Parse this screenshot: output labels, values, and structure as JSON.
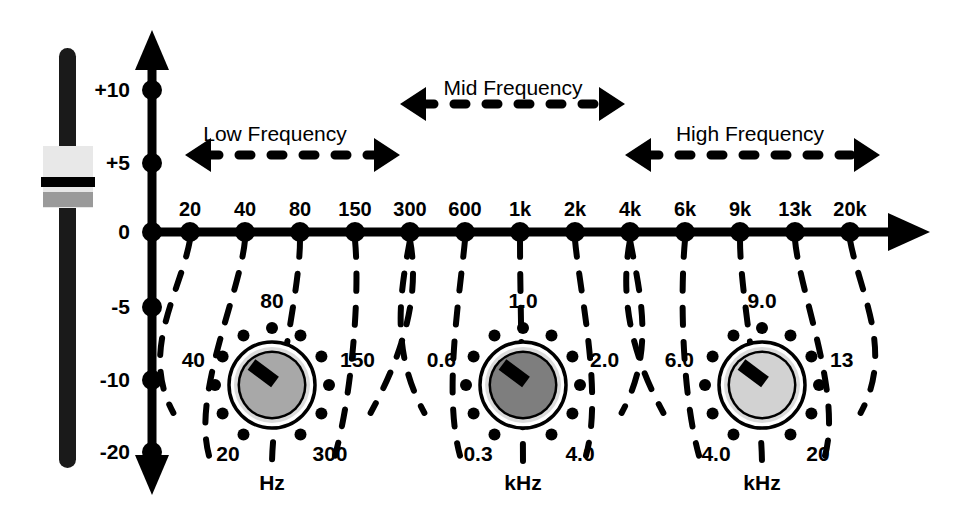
{
  "figure": {
    "type": "equalizer-diagram",
    "background": "#ffffff",
    "ink": "#000000"
  },
  "fader": {
    "name": "level-fader",
    "track_color": "#1a1a1a",
    "cap_color": "#e8e8e8",
    "cap_band_color": "#9a9a9a",
    "position_label": "+5"
  },
  "axes": {
    "y_axis": {
      "label_unit": "dB",
      "ticks": [
        {
          "label": "+10",
          "y": 90
        },
        {
          "label": "+5",
          "y": 163
        },
        {
          "label": "0",
          "y": 232
        },
        {
          "label": "-5",
          "y": 307
        },
        {
          "label": "-10",
          "y": 380
        },
        {
          "label": "-20",
          "y": 452
        }
      ]
    },
    "x_axis": {
      "label_unit": "Hz",
      "ticks": [
        {
          "label": "20",
          "x": 190
        },
        {
          "label": "40",
          "x": 245
        },
        {
          "label": "80",
          "x": 300
        },
        {
          "label": "150",
          "x": 355
        },
        {
          "label": "300",
          "x": 410
        },
        {
          "label": "600",
          "x": 465
        },
        {
          "label": "1k",
          "x": 520
        },
        {
          "label": "2k",
          "x": 575
        },
        {
          "label": "4k",
          "x": 630
        },
        {
          "label": "6k",
          "x": 685
        },
        {
          "label": "9k",
          "x": 740
        },
        {
          "label": "13k",
          "x": 795
        },
        {
          "label": "20k",
          "x": 850
        }
      ]
    }
  },
  "bands": [
    {
      "id": "low",
      "name": "low-frequency-band",
      "label": "Low Frequency",
      "label_x": 275,
      "label_y": 123,
      "arrow_y": 155,
      "arrow_x1": 185,
      "arrow_x2": 400
    },
    {
      "id": "mid",
      "name": "mid-frequency-band",
      "label": "Mid Frequency",
      "label_x": 513,
      "label_y": 77,
      "arrow_y": 104,
      "arrow_x1": 400,
      "arrow_x2": 625
    },
    {
      "id": "high",
      "name": "high-frequency-band",
      "label": "High Frequency",
      "label_x": 750,
      "label_y": 123,
      "arrow_y": 155,
      "arrow_x1": 625,
      "arrow_x2": 880
    }
  ],
  "knobs": [
    {
      "id": "low-knob",
      "name": "low-frequency-knob",
      "cx": 272,
      "cy": 385,
      "face_color": "#a8a8a8",
      "unit": "Hz",
      "unit_y": 472,
      "pointer_angle_deg": 225,
      "dot_count": 11,
      "scale_labels": [
        {
          "text": "40",
          "x": 205,
          "y": 349,
          "anchor": "right"
        },
        {
          "text": "80",
          "x": 272,
          "y": 290,
          "anchor": "center"
        },
        {
          "text": "150",
          "x": 340,
          "y": 349,
          "anchor": "left"
        },
        {
          "text": "20",
          "x": 228,
          "y": 443,
          "anchor": "center"
        },
        {
          "text": "300",
          "x": 330,
          "y": 443,
          "anchor": "center"
        }
      ]
    },
    {
      "id": "mid-knob",
      "name": "mid-frequency-knob",
      "cx": 523,
      "cy": 385,
      "face_color": "#7e7e7e",
      "unit": "kHz",
      "unit_y": 472,
      "pointer_angle_deg": 225,
      "dot_count": 11,
      "scale_labels": [
        {
          "text": "0.6",
          "x": 456,
          "y": 349,
          "anchor": "right"
        },
        {
          "text": "1.0",
          "x": 523,
          "y": 290,
          "anchor": "center"
        },
        {
          "text": "2.0",
          "x": 590,
          "y": 349,
          "anchor": "left"
        },
        {
          "text": "0.3",
          "x": 478,
          "y": 443,
          "anchor": "center"
        },
        {
          "text": "4.0",
          "x": 580,
          "y": 443,
          "anchor": "center"
        }
      ]
    },
    {
      "id": "high-knob",
      "name": "high-frequency-knob",
      "cx": 762,
      "cy": 385,
      "face_color": "#d2d2d2",
      "unit": "kHz",
      "unit_y": 472,
      "pointer_angle_deg": 225,
      "dot_count": 11,
      "scale_labels": [
        {
          "text": "6.0",
          "x": 694,
          "y": 349,
          "anchor": "right"
        },
        {
          "text": "9.0",
          "x": 762,
          "y": 290,
          "anchor": "center"
        },
        {
          "text": "13",
          "x": 830,
          "y": 349,
          "anchor": "left"
        },
        {
          "text": "4.0",
          "x": 716,
          "y": 443,
          "anchor": "center"
        },
        {
          "text": "20",
          "x": 818,
          "y": 443,
          "anchor": "center"
        }
      ]
    }
  ],
  "chart_data": {
    "type": "line",
    "title": "",
    "xlabel": "Hz",
    "ylabel": "dB",
    "x_ticks": [
      "20",
      "40",
      "80",
      "150",
      "300",
      "600",
      "1k",
      "2k",
      "4k",
      "6k",
      "9k",
      "13k",
      "20k"
    ],
    "y_ticks": [
      "+10",
      "+5",
      "0",
      "-5",
      "-10",
      "-20"
    ],
    "grid": false,
    "legend": [
      "Low Frequency",
      "Mid Frequency",
      "High Frequency"
    ],
    "annotations": [
      "Low Frequency band spans 20 Hz to 300 Hz",
      "Mid Frequency band spans 300 Hz to 4k Hz",
      "High Frequency band spans 4k Hz to 20k Hz"
    ],
    "series": [
      {
        "name": "Low Frequency knob scale",
        "values": [
          "20",
          "40",
          "80",
          "150",
          "300"
        ],
        "unit": "Hz"
      },
      {
        "name": "Mid Frequency knob scale",
        "values": [
          "0.3",
          "0.6",
          "1.0",
          "2.0",
          "4.0"
        ],
        "unit": "kHz"
      },
      {
        "name": "High Frequency knob scale",
        "values": [
          "4.0",
          "6.0",
          "9.0",
          "13",
          "20"
        ],
        "unit": "kHz"
      }
    ]
  }
}
